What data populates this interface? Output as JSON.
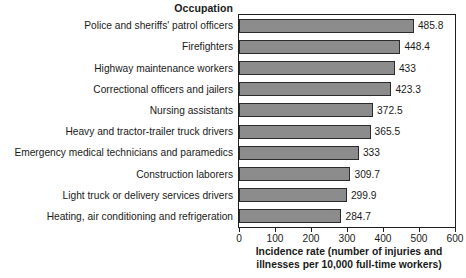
{
  "chart_data": {
    "type": "bar",
    "orientation": "horizontal",
    "title": "",
    "category_axis_title": "Occupation",
    "xlabel": "Incidence rate (number of injuries and illnesses per 10,000 full-time workers)",
    "xlabel_line1": "Incidence rate (number of injuries and",
    "xlabel_line2": "illnesses per 10,000 full-time workers)",
    "ylabel": "",
    "xlim": [
      0,
      600
    ],
    "xticks": [
      0,
      100,
      200,
      300,
      400,
      500,
      600
    ],
    "xtick_labels": [
      "0",
      "100",
      "200",
      "300",
      "400",
      "500",
      "600"
    ],
    "grid": false,
    "legend": false,
    "bar_color": "#8c8c8c",
    "bar_border_color": "#2b2b2b",
    "categories": [
      "Police and sheriffs' patrol officers",
      "Firefighters",
      "Highway maintenance workers",
      "Correctional officers and jailers",
      "Nursing assistants",
      "Heavy and tractor-trailer truck drivers",
      "Emergency medical technicians and paramedics",
      "Construction laborers",
      "Light truck or delivery services drivers",
      "Heating, air conditioning and refrigeration"
    ],
    "values": [
      485.8,
      448.4,
      433,
      423.3,
      372.5,
      365.5,
      333,
      309.7,
      299.9,
      284.7
    ],
    "value_labels": [
      "485.8",
      "448.4",
      "433",
      "423.3",
      "372.5",
      "365.5",
      "333",
      "309.7",
      "299.9",
      "284.7"
    ]
  },
  "bottom_caption": ""
}
